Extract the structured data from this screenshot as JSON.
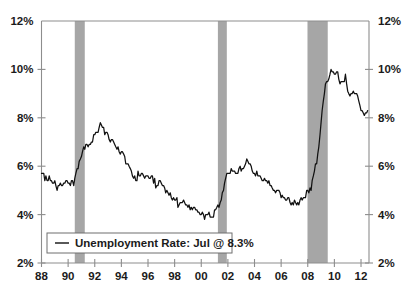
{
  "chart_data": {
    "type": "line",
    "title": "",
    "subtitle": "",
    "xlabel": "",
    "ylabel": "",
    "ylim": [
      2,
      12
    ],
    "xlim": [
      1988.0,
      2012.6
    ],
    "grid": false,
    "legend_position": "bottom-left",
    "y_tick_labels_left": [
      "12%",
      "10%",
      "8%",
      "6%",
      "4%",
      "2%"
    ],
    "y_tick_values_left": [
      12,
      10,
      8,
      6,
      4,
      2
    ],
    "y_tick_labels_right": [
      "12%",
      "10%",
      "8%",
      "6%",
      "4%",
      "2%"
    ],
    "y_tick_values_right": [
      12,
      10,
      8,
      6,
      4,
      2
    ],
    "x_tick_labels": [
      "88",
      "90",
      "92",
      "94",
      "96",
      "98",
      "00",
      "02",
      "04",
      "06",
      "08",
      "10",
      "12"
    ],
    "x_tick_values": [
      1988,
      1990,
      1992,
      1994,
      1996,
      1998,
      2000,
      2002,
      2004,
      2006,
      2008,
      2010,
      2012
    ],
    "legend": [
      {
        "name": "Unemployment Rate: Jul @ 8.3%",
        "color": "#111111",
        "marker": "line"
      }
    ],
    "annotations": [
      {
        "type": "shaded-band",
        "label": "recession-1990-1991",
        "x_start": 1990.5,
        "x_end": 1991.25,
        "color": "#a6a6a6"
      },
      {
        "type": "shaded-band",
        "label": "recession-2001",
        "x_start": 2001.25,
        "x_end": 2001.92,
        "color": "#a6a6a6"
      },
      {
        "type": "shaded-band",
        "label": "recession-2007-2009",
        "x_start": 2007.98,
        "x_end": 2009.5,
        "color": "#a6a6a6"
      }
    ],
    "series": [
      {
        "name": "Unemployment Rate",
        "units": "percent",
        "last_value": 8.3,
        "last_period": "Jul",
        "x": [
          1988.0,
          1988.08,
          1988.17,
          1988.25,
          1988.33,
          1988.42,
          1988.5,
          1988.58,
          1988.67,
          1988.75,
          1988.83,
          1988.92,
          1989.0,
          1989.08,
          1989.17,
          1989.25,
          1989.33,
          1989.42,
          1989.5,
          1989.58,
          1989.67,
          1989.75,
          1989.83,
          1989.92,
          1990.0,
          1990.08,
          1990.17,
          1990.25,
          1990.33,
          1990.42,
          1990.5,
          1990.58,
          1990.67,
          1990.75,
          1990.83,
          1990.92,
          1991.0,
          1991.08,
          1991.17,
          1991.25,
          1991.33,
          1991.42,
          1991.5,
          1991.58,
          1991.67,
          1991.75,
          1991.83,
          1991.92,
          1992.0,
          1992.08,
          1992.17,
          1992.25,
          1992.33,
          1992.42,
          1992.5,
          1992.58,
          1992.67,
          1992.75,
          1992.83,
          1992.92,
          1993.0,
          1993.08,
          1993.17,
          1993.25,
          1993.33,
          1993.42,
          1993.5,
          1993.58,
          1993.67,
          1993.75,
          1993.83,
          1993.92,
          1994.0,
          1994.08,
          1994.17,
          1994.25,
          1994.33,
          1994.42,
          1994.5,
          1994.58,
          1994.67,
          1994.75,
          1994.83,
          1994.92,
          1995.0,
          1995.08,
          1995.17,
          1995.25,
          1995.33,
          1995.42,
          1995.5,
          1995.58,
          1995.67,
          1995.75,
          1995.83,
          1995.92,
          1996.0,
          1996.08,
          1996.17,
          1996.25,
          1996.33,
          1996.42,
          1996.5,
          1996.58,
          1996.67,
          1996.75,
          1996.83,
          1996.92,
          1997.0,
          1997.08,
          1997.17,
          1997.25,
          1997.33,
          1997.42,
          1997.5,
          1997.58,
          1997.67,
          1997.75,
          1997.83,
          1997.92,
          1998.0,
          1998.08,
          1998.17,
          1998.25,
          1998.33,
          1998.42,
          1998.5,
          1998.58,
          1998.67,
          1998.75,
          1998.83,
          1998.92,
          1999.0,
          1999.08,
          1999.17,
          1999.25,
          1999.33,
          1999.42,
          1999.5,
          1999.58,
          1999.67,
          1999.75,
          1999.83,
          1999.92,
          2000.0,
          2000.08,
          2000.17,
          2000.25,
          2000.33,
          2000.42,
          2000.5,
          2000.58,
          2000.67,
          2000.75,
          2000.83,
          2000.92,
          2001.0,
          2001.08,
          2001.17,
          2001.25,
          2001.33,
          2001.42,
          2001.5,
          2001.58,
          2001.67,
          2001.75,
          2001.83,
          2001.92,
          2002.0,
          2002.08,
          2002.17,
          2002.25,
          2002.33,
          2002.42,
          2002.5,
          2002.58,
          2002.67,
          2002.75,
          2002.83,
          2002.92,
          2003.0,
          2003.08,
          2003.17,
          2003.25,
          2003.33,
          2003.42,
          2003.5,
          2003.58,
          2003.67,
          2003.75,
          2003.83,
          2003.92,
          2004.0,
          2004.08,
          2004.17,
          2004.25,
          2004.33,
          2004.42,
          2004.5,
          2004.58,
          2004.67,
          2004.75,
          2004.83,
          2004.92,
          2005.0,
          2005.08,
          2005.17,
          2005.25,
          2005.33,
          2005.42,
          2005.5,
          2005.58,
          2005.67,
          2005.75,
          2005.83,
          2005.92,
          2006.0,
          2006.08,
          2006.17,
          2006.25,
          2006.33,
          2006.42,
          2006.5,
          2006.58,
          2006.67,
          2006.75,
          2006.83,
          2006.92,
          2007.0,
          2007.08,
          2007.17,
          2007.25,
          2007.33,
          2007.42,
          2007.5,
          2007.58,
          2007.67,
          2007.75,
          2007.83,
          2007.92,
          2008.0,
          2008.08,
          2008.17,
          2008.25,
          2008.33,
          2008.42,
          2008.5,
          2008.58,
          2008.67,
          2008.75,
          2008.83,
          2008.92,
          2009.0,
          2009.08,
          2009.17,
          2009.25,
          2009.33,
          2009.42,
          2009.5,
          2009.58,
          2009.67,
          2009.75,
          2009.83,
          2009.92,
          2010.0,
          2010.08,
          2010.17,
          2010.25,
          2010.33,
          2010.42,
          2010.5,
          2010.58,
          2010.67,
          2010.75,
          2010.83,
          2010.92,
          2011.0,
          2011.08,
          2011.17,
          2011.25,
          2011.33,
          2011.42,
          2011.5,
          2011.58,
          2011.67,
          2011.75,
          2011.83,
          2011.92,
          2012.0,
          2012.08,
          2012.17,
          2012.25,
          2012.33,
          2012.42,
          2012.5
        ],
        "values": [
          5.7,
          5.7,
          5.7,
          5.4,
          5.6,
          5.4,
          5.4,
          5.6,
          5.4,
          5.4,
          5.3,
          5.3,
          5.4,
          5.2,
          5.0,
          5.2,
          5.2,
          5.3,
          5.2,
          5.2,
          5.3,
          5.3,
          5.4,
          5.4,
          5.3,
          5.3,
          5.2,
          5.4,
          5.4,
          5.2,
          5.5,
          5.7,
          5.9,
          5.9,
          6.2,
          6.3,
          6.4,
          6.6,
          6.8,
          6.7,
          6.9,
          6.9,
          6.8,
          6.9,
          6.9,
          7.0,
          7.0,
          7.3,
          7.3,
          7.4,
          7.4,
          7.4,
          7.6,
          7.8,
          7.7,
          7.6,
          7.6,
          7.3,
          7.4,
          7.4,
          7.3,
          7.1,
          7.0,
          7.1,
          7.1,
          7.0,
          6.9,
          6.8,
          6.7,
          6.8,
          6.6,
          6.5,
          6.6,
          6.6,
          6.5,
          6.4,
          6.1,
          6.1,
          6.1,
          6.0,
          5.9,
          5.8,
          5.6,
          5.5,
          5.6,
          5.4,
          5.4,
          5.8,
          5.6,
          5.6,
          5.7,
          5.7,
          5.6,
          5.5,
          5.6,
          5.6,
          5.6,
          5.5,
          5.5,
          5.6,
          5.6,
          5.3,
          5.5,
          5.1,
          5.2,
          5.2,
          5.4,
          5.4,
          5.3,
          5.2,
          5.2,
          5.1,
          4.9,
          5.0,
          4.9,
          4.8,
          4.9,
          4.7,
          4.6,
          4.7,
          4.6,
          4.6,
          4.7,
          4.3,
          4.4,
          4.5,
          4.5,
          4.5,
          4.6,
          4.5,
          4.4,
          4.4,
          4.3,
          4.4,
          4.2,
          4.3,
          4.2,
          4.3,
          4.3,
          4.2,
          4.2,
          4.1,
          4.1,
          4.0,
          4.0,
          4.1,
          4.0,
          3.8,
          4.0,
          4.0,
          4.0,
          4.1,
          3.9,
          3.9,
          3.9,
          3.9,
          4.2,
          4.2,
          4.3,
          4.4,
          4.3,
          4.5,
          4.6,
          4.9,
          5.0,
          5.3,
          5.5,
          5.7,
          5.7,
          5.7,
          5.7,
          5.9,
          5.8,
          5.8,
          5.8,
          5.7,
          5.7,
          5.7,
          5.9,
          6.0,
          5.8,
          5.9,
          5.9,
          6.0,
          6.1,
          6.3,
          6.2,
          6.1,
          6.1,
          6.0,
          5.8,
          5.7,
          5.7,
          5.6,
          5.8,
          5.6,
          5.6,
          5.6,
          5.5,
          5.4,
          5.4,
          5.5,
          5.4,
          5.4,
          5.3,
          5.4,
          5.2,
          5.2,
          5.1,
          5.0,
          5.0,
          4.9,
          5.0,
          5.0,
          5.0,
          4.9,
          4.7,
          4.8,
          4.7,
          4.7,
          4.6,
          4.6,
          4.7,
          4.7,
          4.5,
          4.4,
          4.5,
          4.4,
          4.6,
          4.5,
          4.4,
          4.5,
          4.4,
          4.6,
          4.7,
          4.6,
          4.7,
          4.7,
          4.7,
          5.0,
          5.0,
          4.9,
          5.1,
          5.0,
          5.4,
          5.6,
          5.8,
          6.1,
          6.1,
          6.5,
          6.8,
          7.3,
          7.8,
          8.3,
          8.7,
          9.0,
          9.4,
          9.5,
          9.5,
          9.6,
          9.8,
          10.0,
          9.9,
          9.9,
          9.8,
          9.8,
          9.9,
          9.9,
          9.6,
          9.4,
          9.5,
          9.5,
          9.5,
          9.5,
          9.8,
          9.4,
          9.1,
          9.0,
          8.9,
          9.0,
          9.0,
          9.1,
          9.0,
          9.0,
          9.0,
          8.9,
          8.7,
          8.5,
          8.3,
          8.3,
          8.2,
          8.1,
          8.2,
          8.2,
          8.3
        ]
      }
    ]
  },
  "legend_entry_text": "Unemployment Rate: Jul @ 8.3%"
}
